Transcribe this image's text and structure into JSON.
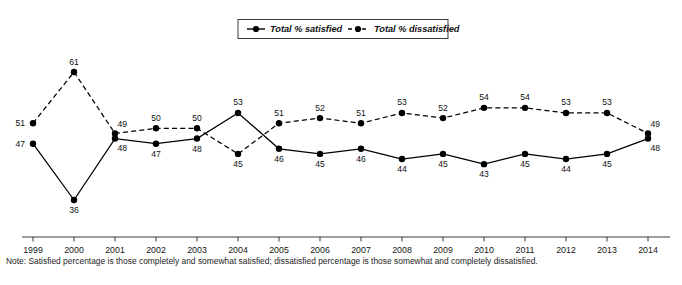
{
  "chart_data": {
    "type": "line",
    "title": "",
    "xlabel": "",
    "ylabel": "",
    "grid": false,
    "legend_position": "top-center",
    "ylim": [
      30,
      65
    ],
    "categories": [
      "1999",
      "2000",
      "2001",
      "2002",
      "2003",
      "2004",
      "2005",
      "2006",
      "2007",
      "2008",
      "2009",
      "2010",
      "2011",
      "2012",
      "2013",
      "2014"
    ],
    "series": [
      {
        "name": "Total % satisfied",
        "style": "solid",
        "color": "#000000",
        "values": [
          47,
          36,
          48,
          47,
          48,
          53,
          46,
          45,
          46,
          44,
          45,
          43,
          45,
          44,
          45,
          48
        ]
      },
      {
        "name": "Total % dissatisfied",
        "style": "dashed",
        "color": "#000000",
        "values": [
          51,
          61,
          49,
          50,
          50,
          45,
          51,
          52,
          51,
          53,
          52,
          54,
          54,
          53,
          53,
          49
        ]
      }
    ]
  },
  "legend": {
    "items": [
      {
        "label": "Total % satisfied",
        "style": "solid"
      },
      {
        "label": "Total % dissatisfied",
        "style": "dashed"
      }
    ]
  },
  "note": {
    "text": "Note: Satisfied percentage is those completely and somewhat satisfied; dissatisfied percentage is those somewhat and completely dissatisfied."
  },
  "source": {
    "text": ""
  }
}
